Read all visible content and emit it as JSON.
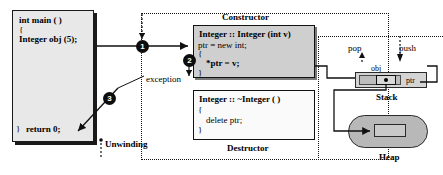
{
  "diagram": {
    "main_block": {
      "name": "main-function",
      "lines": [
        "int main ( )",
        "{",
        "Integer obj (5);",
        "}",
        "return 0;"
      ]
    },
    "constructor": {
      "label": "Constructor",
      "lines": [
        "Integer :: Integer (int v)",
        "ptr = new int;",
        "{",
        "*ptr = v;",
        "}"
      ]
    },
    "destructor": {
      "label": "Destructor",
      "lines": [
        "Integer :: ~Integer ( )",
        "{",
        "delete ptr;",
        "}"
      ]
    },
    "steps": [
      {
        "id": "1",
        "label": "1"
      },
      {
        "id": "2",
        "label": "2"
      },
      {
        "id": "3",
        "label": "3"
      }
    ],
    "annotations": {
      "exception": "exception",
      "unwinding": "Unwinding",
      "pop": "pop",
      "push": "push"
    },
    "memory": {
      "stack_label": "Stack",
      "heap_label": "Heap",
      "obj_label": "obj",
      "ptr_label": "ptr"
    },
    "colors": {
      "outline": "#111111",
      "code_block_fill": "#e8e8e8",
      "constructor_fill": "#cfcfcf",
      "destructor_fill": "#fafafa",
      "stack_fill": "#d4d4d4",
      "heap_fill": "#b8b8b8",
      "badge_fill": "#0d0d0d"
    }
  }
}
